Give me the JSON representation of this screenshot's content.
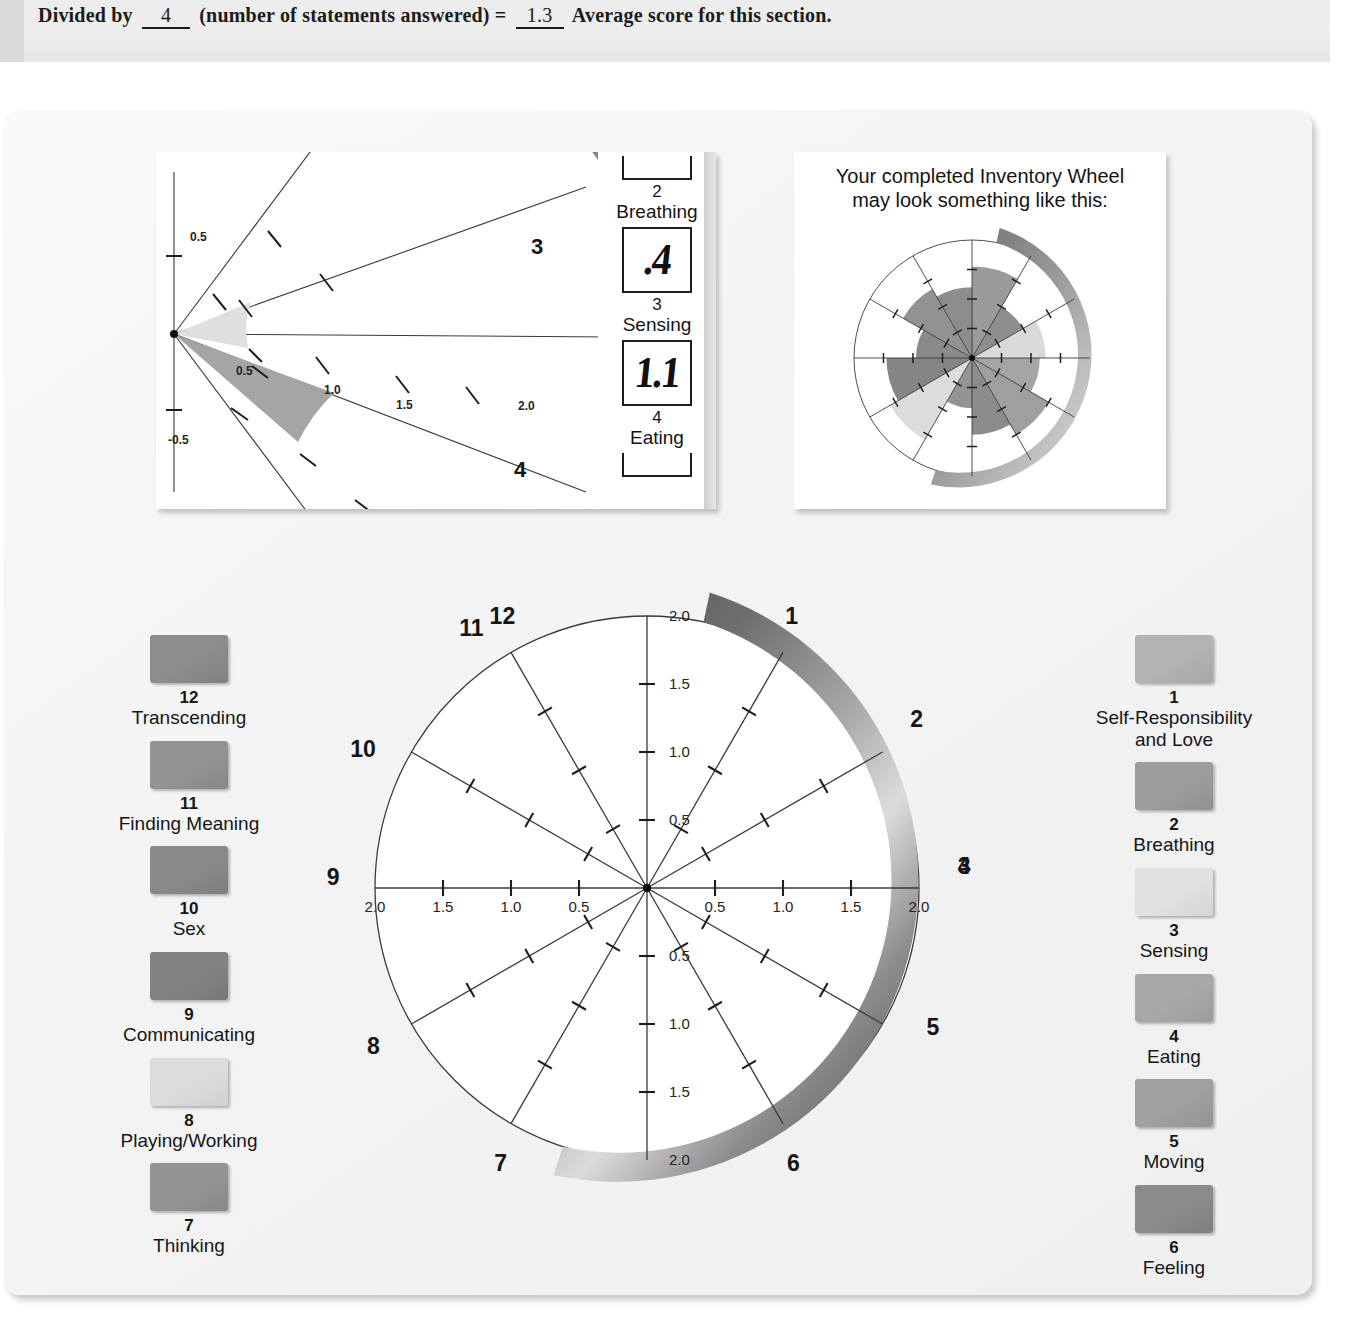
{
  "top_bar": {
    "prefix": "Divided by",
    "divisor_value": "4",
    "middle": "(number of statements answered)",
    "equals": "=",
    "result_value": "1.3",
    "suffix": "Average score for this section."
  },
  "inset_right": {
    "title_line1": "Your completed Inventory Wheel",
    "title_line2": "may look something like this:"
  },
  "inset_left": {
    "tick_labels": [
      "0.5",
      "0.5",
      "1.0",
      "1.5",
      "2.0",
      "-0.5"
    ],
    "sector_numbers": [
      "3",
      "4"
    ],
    "score_entries": [
      {
        "number": "2",
        "label": "Breathing",
        "value": "",
        "cut": true
      },
      {
        "number": "3",
        "label": "Sensing",
        "value": ".4",
        "cut": false
      },
      {
        "number": "4",
        "label": "Eating",
        "value": "1.1",
        "cut": false
      },
      {
        "number": "",
        "label": "",
        "value": "",
        "cut": true
      }
    ]
  },
  "legend_left": [
    {
      "number": "12",
      "label": "Transcending",
      "color": "#8d8d8d"
    },
    {
      "number": "11",
      "label": "Finding Meaning",
      "color": "#939393"
    },
    {
      "number": "10",
      "label": "Sex",
      "color": "#8a8a8a"
    },
    {
      "number": "9",
      "label": "Communicating",
      "color": "#838383"
    },
    {
      "number": "8",
      "label": "Playing/Working",
      "color": "#dcdcdc"
    },
    {
      "number": "7",
      "label": "Thinking",
      "color": "#949494"
    }
  ],
  "legend_right": [
    {
      "number": "1",
      "label": "Self-Responsibility\nand Love",
      "color": "#b3b3b3"
    },
    {
      "number": "2",
      "label": "Breathing",
      "color": "#9d9d9d"
    },
    {
      "number": "3",
      "label": "Sensing",
      "color": "#e1e1e1"
    },
    {
      "number": "4",
      "label": "Eating",
      "color": "#a8a8a8"
    },
    {
      "number": "5",
      "label": "Moving",
      "color": "#a0a0a0"
    },
    {
      "number": "6",
      "label": "Feeling",
      "color": "#8b8b8b"
    }
  ],
  "colors": {
    "page_bg": "#ffffff",
    "panel_bg": "#f4f4f4",
    "top_strip_bg": "#ececec",
    "ink": "#1a1a1a",
    "wheel_line": "#3a3a3a",
    "rim_dark": "#4d4d4d",
    "rim_light": "#d6d6d6"
  },
  "chart_data": {
    "type": "radar",
    "title": "Inventory Wheel",
    "sector_numbers": [
      "1",
      "2",
      "3",
      "4",
      "5",
      "6",
      "7",
      "8",
      "9",
      "10",
      "11",
      "12"
    ],
    "sector_labels": [
      "Self-Responsibility and Love",
      "Breathing",
      "Sensing",
      "Eating",
      "Moving",
      "Feeling",
      "Thinking",
      "Playing/Working",
      "Communicating",
      "Sex",
      "Finding Meaning",
      "Transcending"
    ],
    "radial_axis": {
      "ticks": [
        0.5,
        1.0,
        1.5,
        2.0
      ],
      "tick_labels": [
        "0.5",
        "1.0",
        "1.5",
        "2.0"
      ],
      "range": [
        0,
        2.0
      ]
    },
    "labeled_axes": {
      "top": {
        "angle_deg": 90,
        "tick_labels": [
          "0.5",
          "1.0",
          "1.5",
          "2.0"
        ]
      },
      "right": {
        "angle_deg": 0,
        "tick_labels": [
          "0.5",
          "1.0",
          "1.5",
          "2.0"
        ]
      },
      "bottom": {
        "angle_deg": 270,
        "tick_labels": [
          "0.5",
          "1.0",
          "1.5",
          "2.0"
        ]
      },
      "left": {
        "angle_deg": 180,
        "tick_labels": [
          "0.5",
          "1.0",
          "1.5",
          "2.0"
        ]
      }
    },
    "values": [
      null,
      null,
      null,
      null,
      null,
      null,
      null,
      null,
      null,
      null,
      null,
      null
    ],
    "grid": true,
    "legend": "both-sides",
    "note": "Blank worksheet wheel: 12 unfilled sectors, each spoke marked at 0.5 intervals up to 2.0"
  },
  "inset_right_chart": {
    "type": "radar",
    "sectors": 12,
    "values": [
      1.55,
      1.0,
      1.25,
      1.15,
      1.5,
      1.3,
      0.85,
      1.6,
      1.45,
      0.95,
      1.35,
      1.2
    ],
    "range": [
      0,
      2.0
    ],
    "note": "Example completed wheel with shaded sectors of varying lengths"
  },
  "inset_left_chart": {
    "type": "radar-detail",
    "shown_sectors": [
      "3",
      "4"
    ],
    "values": {
      "3": 0.4,
      "4": 1.1
    },
    "tick_labels": [
      "0.5",
      "1.0",
      "1.5",
      "2.0",
      "-0.5"
    ],
    "range": [
      0,
      2.0
    ]
  }
}
